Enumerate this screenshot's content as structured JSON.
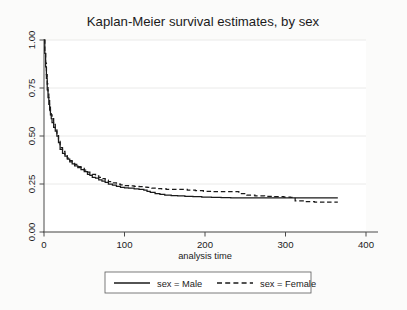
{
  "figure": {
    "background_color": "#fbfbfa",
    "plot_background_color": "#ffffff"
  },
  "chart_data": {
    "type": "line",
    "title": "Kaplan-Meier survival estimates, by sex",
    "xlabel": "analysis time",
    "ylabel": "",
    "xlim": [
      0,
      400
    ],
    "ylim": [
      0,
      1
    ],
    "xticks": [
      0,
      100,
      200,
      300,
      400
    ],
    "xticklabels": [
      "0",
      "100",
      "200",
      "300",
      "400"
    ],
    "yticks": [
      0.0,
      0.25,
      0.5,
      0.75,
      1.0
    ],
    "yticklabels": [
      "0.00",
      "0.25",
      "0.50",
      "0.75",
      "1.00"
    ],
    "grid": "horizontal",
    "grid_color": "#e8e8e6",
    "legend_position": "below",
    "line_color": "#1a1a1a",
    "series": [
      {
        "name": "sex = Male",
        "style": "solid",
        "x": [
          0,
          1,
          2,
          3,
          4,
          5,
          6,
          7,
          8,
          9,
          10,
          12,
          14,
          16,
          18,
          20,
          23,
          26,
          29,
          32,
          35,
          38,
          42,
          46,
          50,
          54,
          57,
          60,
          64,
          68,
          72,
          76,
          80,
          85,
          90,
          95,
          100,
          105,
          112,
          118,
          124,
          128,
          132,
          138,
          144,
          150,
          158,
          166,
          175,
          185,
          196,
          208,
          220,
          232,
          240,
          248,
          258,
          270,
          282,
          295,
          305,
          318,
          332,
          345,
          358,
          365
        ],
        "y": [
          1.0,
          0.93,
          0.86,
          0.8,
          0.74,
          0.7,
          0.665,
          0.635,
          0.61,
          0.59,
          0.57,
          0.545,
          0.525,
          0.5,
          0.465,
          0.43,
          0.41,
          0.395,
          0.38,
          0.365,
          0.355,
          0.345,
          0.335,
          0.325,
          0.315,
          0.3,
          0.295,
          0.285,
          0.28,
          0.272,
          0.265,
          0.258,
          0.25,
          0.244,
          0.238,
          0.233,
          0.23,
          0.228,
          0.225,
          0.222,
          0.218,
          0.212,
          0.206,
          0.2,
          0.196,
          0.192,
          0.19,
          0.188,
          0.186,
          0.184,
          0.182,
          0.18,
          0.179,
          0.178,
          0.178,
          0.178,
          0.178,
          0.178,
          0.178,
          0.178,
          0.178,
          0.178,
          0.178,
          0.178,
          0.178,
          0.178
        ]
      },
      {
        "name": "sex = Female",
        "style": "dashed",
        "x": [
          0,
          1,
          2,
          3,
          4,
          5,
          6,
          7,
          8,
          9,
          10,
          12,
          14,
          16,
          18,
          20,
          23,
          26,
          29,
          32,
          35,
          38,
          42,
          46,
          50,
          54,
          57,
          60,
          64,
          68,
          72,
          76,
          80,
          85,
          90,
          95,
          100,
          105,
          112,
          118,
          124,
          128,
          134,
          140,
          146,
          152,
          160,
          168,
          178,
          188,
          198,
          210,
          222,
          234,
          242,
          252,
          262,
          274,
          286,
          298,
          306,
          312,
          322,
          336,
          350,
          365
        ],
        "y": [
          1.0,
          0.94,
          0.88,
          0.82,
          0.77,
          0.73,
          0.69,
          0.655,
          0.63,
          0.61,
          0.59,
          0.56,
          0.54,
          0.515,
          0.48,
          0.44,
          0.42,
          0.4,
          0.385,
          0.372,
          0.362,
          0.352,
          0.34,
          0.332,
          0.322,
          0.312,
          0.305,
          0.3,
          0.292,
          0.285,
          0.278,
          0.27,
          0.262,
          0.256,
          0.25,
          0.246,
          0.242,
          0.24,
          0.238,
          0.236,
          0.234,
          0.232,
          0.228,
          0.226,
          0.224,
          0.222,
          0.222,
          0.222,
          0.218,
          0.215,
          0.212,
          0.21,
          0.21,
          0.21,
          0.2,
          0.192,
          0.188,
          0.186,
          0.184,
          0.182,
          0.18,
          0.162,
          0.158,
          0.156,
          0.155,
          0.155
        ]
      }
    ],
    "legend": [
      {
        "label": "sex = Male",
        "style": "solid"
      },
      {
        "label": "sex = Female",
        "style": "dashed"
      }
    ]
  }
}
